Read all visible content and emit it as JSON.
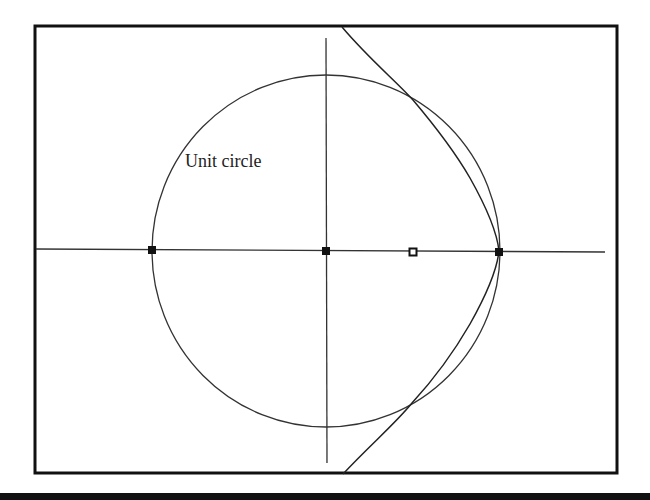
{
  "figure": {
    "label_text": "Unit circle",
    "colors": {
      "stroke": "#222222",
      "frame": "#111111",
      "background": "#ffffff"
    }
  },
  "geometry": {
    "frame": {
      "x": 35,
      "y": 26,
      "width": 582,
      "height": 447
    },
    "origin_px": {
      "x": 326,
      "y": 251
    },
    "unit_px": 175,
    "horizontal_axis": {
      "x1": 36,
      "y1": 249,
      "x2": 605,
      "y2": 252
    },
    "vertical_axis": {
      "x1": 326,
      "y1": 38,
      "x2": 327,
      "y2": 463
    },
    "unit_circle": {
      "cx": 326,
      "cy": 251,
      "rx": 174,
      "ry": 176
    },
    "curve_points_px": [
      [
        342,
        28
      ],
      [
        413,
        100
      ],
      [
        453,
        150
      ],
      [
        484,
        200
      ],
      [
        499,
        251
      ],
      [
        484,
        302
      ],
      [
        453,
        352
      ],
      [
        412,
        403
      ],
      [
        343,
        474
      ]
    ],
    "points": [
      {
        "name": "minus-one",
        "unit": [
          -1,
          0
        ],
        "px": [
          152,
          250
        ],
        "style": "filled"
      },
      {
        "name": "origin",
        "unit": [
          0,
          0
        ],
        "px": [
          326,
          251
        ],
        "style": "filled"
      },
      {
        "name": "one-half",
        "unit": [
          0.5,
          0
        ],
        "px": [
          413,
          252
        ],
        "style": "hollow"
      },
      {
        "name": "one",
        "unit": [
          1,
          0
        ],
        "px": [
          499,
          252
        ],
        "style": "filled"
      }
    ],
    "intersections": [
      {
        "unit": [
          0.5,
          0.866
        ],
        "px": [
          413,
          100
        ]
      },
      {
        "unit": [
          0.5,
          -0.866
        ],
        "px": [
          412,
          403
        ]
      }
    ]
  }
}
